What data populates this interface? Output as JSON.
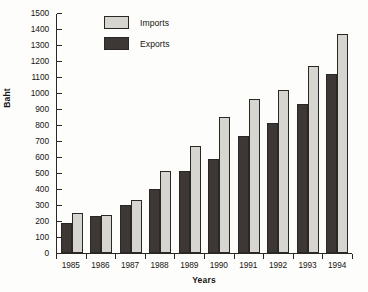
{
  "chart_data": {
    "type": "bar",
    "title": "",
    "xlabel": "Years",
    "ylabel": "Baht",
    "categories": [
      "1985",
      "1986",
      "1987",
      "1988",
      "1989",
      "1990",
      "1991",
      "1992",
      "1993",
      "1994"
    ],
    "series": [
      {
        "name": "Exports",
        "color": "#3d3835",
        "values": [
          190,
          230,
          300,
          400,
          510,
          590,
          730,
          810,
          930,
          1120
        ]
      },
      {
        "name": "Imports",
        "color": "#d6d5d0",
        "values": [
          250,
          240,
          330,
          510,
          670,
          850,
          960,
          1020,
          1170,
          1370
        ]
      }
    ],
    "ylim": [
      0,
      1500
    ],
    "ytick_step": 100,
    "yticks": [
      0,
      100,
      200,
      300,
      400,
      500,
      600,
      700,
      800,
      900,
      1000,
      1100,
      1200,
      1300,
      1400,
      1500
    ],
    "ytick_labels": [
      "0",
      "100",
      "200",
      "300",
      "400",
      "500",
      "600",
      "700",
      "800",
      "900",
      "1000",
      "1100",
      "1200",
      "1300",
      "1400",
      "1500"
    ],
    "grid": false,
    "legend_position": "top-left-inside",
    "legend_order": [
      "Imports",
      "Exports"
    ],
    "bar_order_in_group": [
      "Exports",
      "Imports"
    ]
  },
  "legend": {
    "items": [
      {
        "label": "Imports",
        "swatch": "imports"
      },
      {
        "label": "Exports",
        "swatch": "exports"
      }
    ]
  },
  "axes": {
    "y_title": "Baht",
    "x_title": "Years"
  }
}
